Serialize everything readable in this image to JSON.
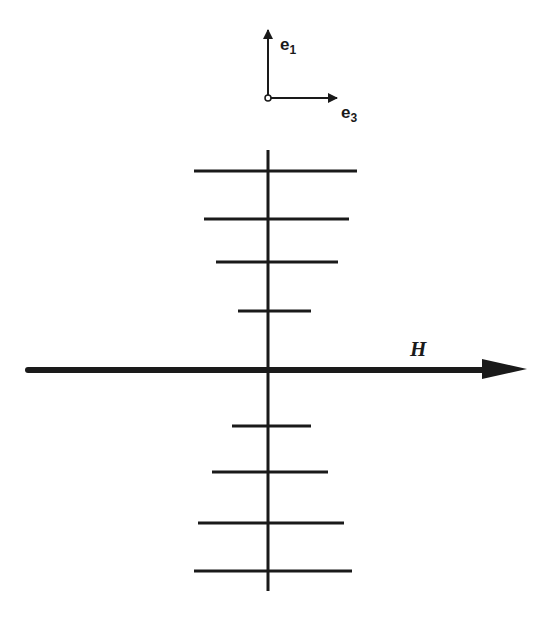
{
  "diagram": {
    "type": "field-line schematic",
    "colors": {
      "ink": "#1a1a1a",
      "background": "#ffffff"
    },
    "axes": {
      "origin": [
        268,
        98
      ],
      "vertical": {
        "label": "e",
        "subscript": "1",
        "tip": [
          268,
          27
        ]
      },
      "horizontal": {
        "label": "e",
        "subscript": "3",
        "tip": [
          340,
          98
        ]
      }
    },
    "field_arrow": {
      "label": "H",
      "from": [
        28,
        370
      ],
      "to": [
        527,
        370
      ]
    },
    "vertical_line": {
      "x": 268,
      "y_top": 150,
      "y_bottom": 591
    },
    "bars": [
      {
        "y": 171,
        "x1": 194,
        "x2": 357
      },
      {
        "y": 219,
        "x1": 204,
        "x2": 349
      },
      {
        "y": 262,
        "x1": 216,
        "x2": 338
      },
      {
        "y": 311,
        "x1": 238,
        "x2": 311
      },
      {
        "y": 426,
        "x1": 232,
        "x2": 311
      },
      {
        "y": 472,
        "x1": 212,
        "x2": 328
      },
      {
        "y": 523,
        "x1": 198,
        "x2": 344
      },
      {
        "y": 571,
        "x1": 194,
        "x2": 352
      }
    ]
  }
}
